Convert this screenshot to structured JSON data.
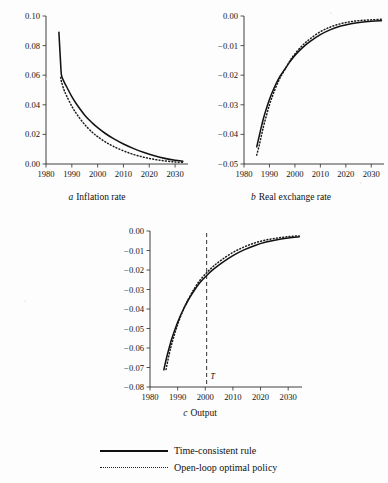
{
  "figure": {
    "background_color": "#fdfdfd",
    "ink_color": "#121212"
  },
  "legend": {
    "position": "below-charts",
    "items": [
      {
        "label": "Time-consistent rule",
        "style": "solid",
        "sample": "solid-line-sample"
      },
      {
        "label": "Open-loop optimal policy",
        "style": "dotted",
        "sample": "dotted-line-sample"
      }
    ]
  },
  "chart_data": [
    {
      "type": "line",
      "panel": "a",
      "title": "Inflation rate",
      "caption_letter": "a",
      "xlabel": "",
      "ylabel": "",
      "xlim": [
        1980,
        2035
      ],
      "ylim": [
        0.0,
        0.1
      ],
      "xticks": [
        1980,
        1990,
        2000,
        2010,
        2020,
        2030
      ],
      "xticklabels": [
        "1980",
        "1990",
        "2000",
        "2010",
        "2020",
        "2030"
      ],
      "yticks": [
        0.0,
        0.02,
        0.04,
        0.06,
        0.08,
        0.1
      ],
      "yticklabels": [
        "0.00",
        "0.02",
        "0.04",
        "0.06",
        "0.08",
        "0.10"
      ],
      "grid": false,
      "series": [
        {
          "name": "Time-consistent rule",
          "style": "solid",
          "x": [
            1985,
            1985.6,
            1986,
            1987,
            1988,
            1990,
            1992,
            1995,
            1998,
            2000,
            2003,
            2006,
            2010,
            2014,
            2018,
            2022,
            2026,
            2030,
            2033
          ],
          "values": [
            0.089,
            0.07,
            0.06,
            0.0555,
            0.0522,
            0.0455,
            0.04,
            0.033,
            0.0276,
            0.0246,
            0.0206,
            0.0173,
            0.0135,
            0.0104,
            0.0078,
            0.0056,
            0.0038,
            0.0025,
            0.0019
          ]
        },
        {
          "name": "Open-loop optimal policy",
          "style": "dotted",
          "x": [
            1985.7,
            1986,
            1987,
            1988,
            1990,
            1992,
            1995,
            1998,
            2000,
            2003,
            2006,
            2010,
            2014,
            2018,
            2022,
            2026,
            2030,
            2033
          ],
          "values": [
            0.0585,
            0.0555,
            0.05,
            0.046,
            0.039,
            0.0335,
            0.0266,
            0.0213,
            0.0185,
            0.0149,
            0.012,
            0.0089,
            0.0064,
            0.0045,
            0.0031,
            0.0021,
            0.0014,
            0.0011
          ]
        }
      ]
    },
    {
      "type": "line",
      "panel": "b",
      "title": "Real exchange rate",
      "caption_letter": "b",
      "xlabel": "",
      "ylabel": "",
      "xlim": [
        1980,
        2035
      ],
      "ylim": [
        -0.05,
        0.0
      ],
      "xticks": [
        1980,
        1990,
        2000,
        2010,
        2020,
        2030
      ],
      "xticklabels": [
        "1980",
        "1990",
        "2000",
        "2010",
        "2020",
        "2030"
      ],
      "yticks": [
        -0.05,
        -0.04,
        -0.03,
        -0.02,
        -0.01,
        0.0
      ],
      "yticklabels": [
        "-0.05",
        "-0.04",
        "-0.03",
        "-0.02",
        "-0.01",
        "0.00"
      ],
      "grid": false,
      "series": [
        {
          "name": "Time-consistent rule",
          "style": "solid",
          "x": [
            1985,
            1986,
            1987,
            1988,
            1990,
            1992,
            1994,
            1996,
            1998,
            2000,
            2003,
            2006,
            2010,
            2014,
            2018,
            2022,
            2026,
            2030,
            2034
          ],
          "values": [
            -0.0442,
            -0.0405,
            -0.0368,
            -0.0335,
            -0.0282,
            -0.024,
            -0.0206,
            -0.018,
            -0.0155,
            -0.0133,
            -0.0107,
            -0.0086,
            -0.0063,
            -0.0046,
            -0.0034,
            -0.0026,
            -0.0021,
            -0.0018,
            -0.0016
          ]
        },
        {
          "name": "Open-loop optimal policy",
          "style": "dotted",
          "x": [
            1985,
            1986,
            1987,
            1988,
            1990,
            1992,
            1994,
            1996,
            1998,
            2000,
            2003,
            2006,
            2010,
            2014,
            2018,
            2022,
            2026,
            2030,
            2034
          ],
          "values": [
            -0.047,
            -0.0436,
            -0.0398,
            -0.0362,
            -0.03,
            -0.0252,
            -0.0212,
            -0.0182,
            -0.0152,
            -0.0128,
            -0.0099,
            -0.0077,
            -0.0053,
            -0.0037,
            -0.0026,
            -0.0019,
            -0.0015,
            -0.0013,
            -0.0011
          ]
        }
      ]
    },
    {
      "type": "line",
      "panel": "c",
      "title": "Output",
      "caption_letter": "c",
      "xlabel": "",
      "ylabel": "",
      "xlim": [
        1980,
        2035
      ],
      "ylim": [
        -0.08,
        0.0
      ],
      "xticks": [
        1980,
        1990,
        2000,
        2010,
        2020,
        2030
      ],
      "xticklabels": [
        "1980",
        "1990",
        "2000",
        "2010",
        "2020",
        "2030"
      ],
      "yticks": [
        -0.08,
        -0.07,
        -0.06,
        -0.05,
        -0.04,
        -0.03,
        -0.02,
        -0.01,
        0.0
      ],
      "yticklabels": [
        "-0.08",
        "-0.07",
        "-0.06",
        "-0.05",
        "-0.04",
        "-0.03",
        "-0.02",
        "-0.01",
        "0.00"
      ],
      "grid": false,
      "annotations": [
        {
          "type": "vline",
          "x": 2000.5,
          "label": "T̄",
          "style": "dashed"
        }
      ],
      "series": [
        {
          "name": "Time-consistent rule",
          "style": "solid",
          "x": [
            1985,
            1986,
            1987,
            1988,
            1990,
            1992,
            1994,
            1996,
            1998,
            2000.5,
            2003,
            2006,
            2010,
            2014,
            2018,
            2022,
            2026,
            2030,
            2034
          ],
          "values": [
            -0.0712,
            -0.065,
            -0.0596,
            -0.0548,
            -0.0468,
            -0.0404,
            -0.035,
            -0.0305,
            -0.0266,
            -0.0228,
            -0.0196,
            -0.0163,
            -0.0126,
            -0.0097,
            -0.0074,
            -0.0057,
            -0.0045,
            -0.0036,
            -0.003
          ]
        },
        {
          "name": "Open-loop optimal policy",
          "style": "dotted",
          "x": [
            1985.8,
            1987,
            1988,
            1990,
            1992,
            1994,
            1996,
            1998,
            2000.5,
            2003,
            2006,
            2010,
            2014,
            2018,
            2022,
            2026,
            2030,
            2034
          ],
          "values": [
            -0.071,
            -0.0628,
            -0.0572,
            -0.048,
            -0.0406,
            -0.0346,
            -0.0296,
            -0.0254,
            -0.0214,
            -0.018,
            -0.0147,
            -0.011,
            -0.0082,
            -0.0061,
            -0.0046,
            -0.0036,
            -0.0029,
            -0.0025
          ]
        }
      ]
    }
  ]
}
